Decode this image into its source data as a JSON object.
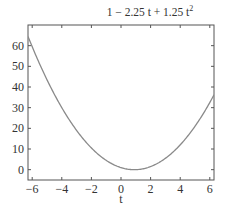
{
  "chart_data": {
    "type": "line",
    "title_parts": {
      "main": "1 − 2.25 t + 1.25 t",
      "sup": "2"
    },
    "xlabel": "t",
    "ylabel": "",
    "xlim": [
      -6.2832,
      6.2832
    ],
    "ylim": [
      -5,
      70
    ],
    "xticks": [
      -6,
      -4,
      -2,
      0,
      2,
      4,
      6
    ],
    "xtick_labels": [
      "−6",
      "−4",
      "−2",
      "0",
      "2",
      "4",
      "6"
    ],
    "yticks": [
      0,
      10,
      20,
      30,
      40,
      50,
      60
    ],
    "ytick_labels": [
      "0",
      "10",
      "20",
      "30",
      "40",
      "50",
      "60"
    ],
    "grid": false,
    "legend": null,
    "series": [
      {
        "name": "1 - 2.25 t + 1.25 t^2",
        "function": {
          "c0": 1,
          "c1": -2.25,
          "c2": 1.25
        },
        "x": [
          -6.2832,
          -5,
          -4,
          -3,
          -2,
          -1,
          0,
          0.9,
          2,
          3,
          4,
          5,
          6.2832
        ],
        "values": [
          64.48,
          43.5,
          30.0,
          19.0,
          10.5,
          4.5,
          1.0,
          -0.01,
          1.5,
          5.5,
          12.0,
          21.0,
          36.21
        ],
        "color": "#8a8a8a"
      }
    ]
  },
  "colors": {
    "axes": "#555555",
    "curve": "#8a8a8a",
    "text": "#333333",
    "background": "#ffffff"
  }
}
